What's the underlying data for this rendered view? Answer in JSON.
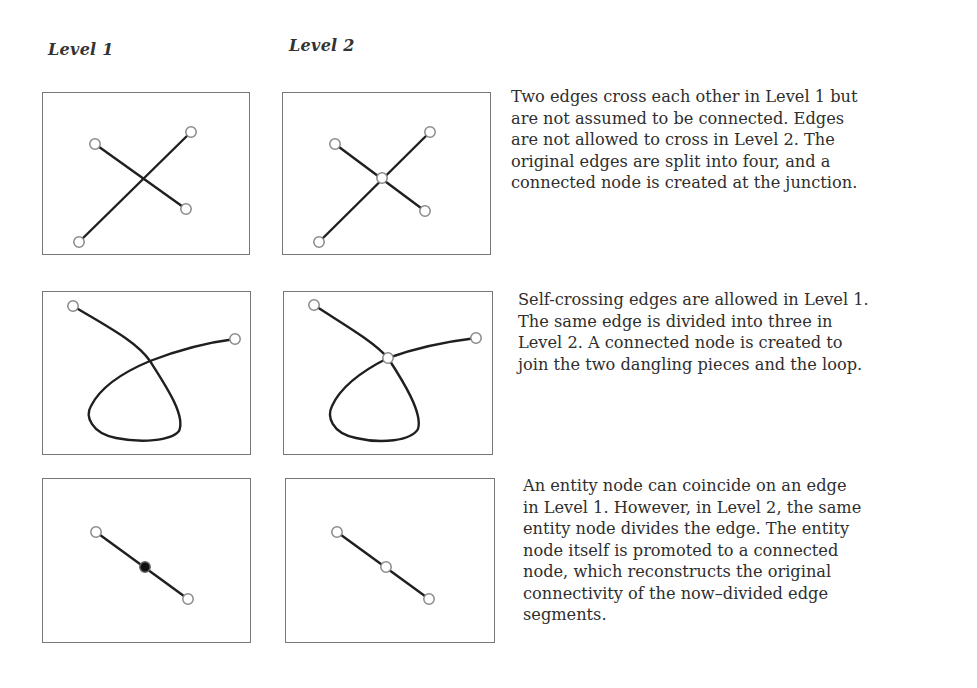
{
  "columns": {
    "level1": "Level 1",
    "level2": "Level 2"
  },
  "rows": [
    {
      "id": "crossing-edges",
      "description": "Two edges cross each other in Level 1 but\nare not assumed to be connected.  Edges\nare not allowed to cross in Level 2.  The\noriginal edges are split into four, and a\nconnected node is created at the junction.",
      "level1": {
        "edges": [
          [
            [
              94,
              143
            ],
            [
              185,
              208
            ]
          ],
          [
            [
              78,
              241
            ],
            [
              190,
              131
            ]
          ]
        ],
        "nodes": [
          [
            94,
            143
          ],
          [
            190,
            131
          ],
          [
            185,
            208
          ],
          [
            78,
            241
          ]
        ],
        "entity_nodes": []
      },
      "level2": {
        "edges": [
          [
            [
              334,
              143
            ],
            [
              381,
              177
            ]
          ],
          [
            [
              381,
              177
            ],
            [
              424,
              210
            ]
          ],
          [
            [
              318,
              241
            ],
            [
              381,
              177
            ]
          ],
          [
            [
              381,
              177
            ],
            [
              429,
              131
            ]
          ]
        ],
        "nodes": [
          [
            334,
            143
          ],
          [
            429,
            131
          ],
          [
            424,
            210
          ],
          [
            318,
            241
          ],
          [
            381,
            177
          ]
        ],
        "entity_nodes": []
      }
    },
    {
      "id": "self-crossing-edge",
      "description": "Self-crossing edges are allowed in Level 1.\nThe same edge is divided into three in\nLevel 2.  A connected node is created to\njoin the two dangling pieces and the loop.",
      "level1": {
        "nodes": [
          [
            72,
            305
          ],
          [
            234,
            338
          ]
        ],
        "entity_nodes": []
      },
      "level2": {
        "nodes": [
          [
            313,
            304
          ],
          [
            475,
            337
          ],
          [
            387,
            357
          ]
        ],
        "entity_nodes": []
      }
    },
    {
      "id": "entity-node-on-edge",
      "description": "An entity node can coincide on an edge\nin Level 1.  However, in Level 2, the same\nentity node divides the edge.  The entity\nnode itself is promoted to a connected\nnode, which reconstructs the original\nconnectivity of the now–divided edge\nsegments.",
      "level1": {
        "edges": [
          [
            [
              95,
              531
            ],
            [
              187,
              598
            ]
          ]
        ],
        "nodes": [
          [
            95,
            531
          ],
          [
            187,
            598
          ]
        ],
        "entity_nodes": [
          [
            144,
            566
          ]
        ]
      },
      "level2": {
        "edges": [
          [
            [
              336,
              531
            ],
            [
              385,
              566
            ]
          ],
          [
            [
              385,
              566
            ],
            [
              428,
              598
            ]
          ]
        ],
        "nodes": [
          [
            336,
            531
          ],
          [
            385,
            566
          ],
          [
            428,
            598
          ]
        ],
        "entity_nodes": []
      }
    }
  ],
  "colors": {
    "edge": "#1f1f1f",
    "node_outline": "#8a8a8a",
    "entity_node_fill": "#111111",
    "panel_border": "#777777"
  }
}
